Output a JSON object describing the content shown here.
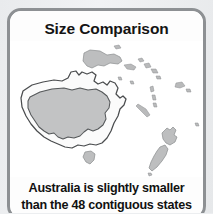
{
  "card": {
    "title": "Size Comparison",
    "caption_line1": "Australia is slightly smaller",
    "caption_line2": "than the 48 contiguous states",
    "border_color": "#8d9093",
    "background_color": "#ffffff"
  },
  "page": {
    "background_color": "#eceef0"
  },
  "map": {
    "title": "Oceania size comparison map",
    "regions": [
      {
        "name": "australia-outline",
        "label": "Australia",
        "role": "reference-outline",
        "fill": "#fbfbfb",
        "stroke": "#4a4c4e"
      },
      {
        "name": "us-contiguous-overlay",
        "label": "48 contiguous United States",
        "role": "overlay",
        "fill": "#bdbebf",
        "stroke": "#55585a"
      },
      {
        "name": "tasmania",
        "label": "Tasmania",
        "role": "landmass",
        "fill": "#bdbebf"
      },
      {
        "name": "papua-new-guinea",
        "label": "Papua New Guinea",
        "role": "landmass",
        "fill": "#bdbebf"
      },
      {
        "name": "new-zealand-north-island",
        "label": "New Zealand North Island",
        "role": "landmass",
        "fill": "#bdbebf"
      },
      {
        "name": "new-zealand-south-island",
        "label": "New Zealand South Island",
        "role": "landmass",
        "fill": "#bdbebf"
      },
      {
        "name": "solomon-islands",
        "label": "Solomon Islands",
        "role": "islet",
        "fill": "#b9babb"
      },
      {
        "name": "vanuatu",
        "label": "Vanuatu",
        "role": "islet",
        "fill": "#b9babb"
      },
      {
        "name": "fiji",
        "label": "Fiji",
        "role": "islet",
        "fill": "#b9babb"
      },
      {
        "name": "new-caledonia",
        "label": "New Caledonia",
        "role": "islet",
        "fill": "#b9babb"
      }
    ]
  }
}
